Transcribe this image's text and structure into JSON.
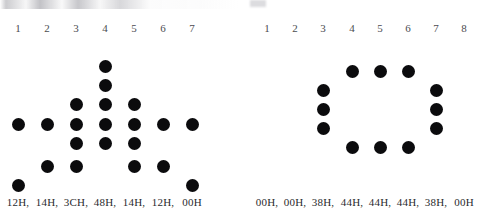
{
  "figure": {
    "dot_color": "#0b0b0d",
    "background_color": "#ffffff",
    "header_color": "#4b4b50",
    "label_color": "#2a2a2e"
  },
  "panels": [
    {
      "id": "left",
      "name": "left-dot-matrix",
      "columns": 7,
      "rows": 8,
      "column_headers": [
        "1",
        "2",
        "3",
        "4",
        "5",
        "6",
        "7"
      ],
      "column_labels": [
        "12H,",
        "14H,",
        "3CH,",
        "48H,",
        "14H,",
        "12H,",
        "00H"
      ],
      "column_bits": [
        {
          "header": "1",
          "label": "12H,",
          "hex": "12H",
          "rows_on": [
            4,
            8
          ]
        },
        {
          "header": "2",
          "label": "14H,",
          "hex": "14H",
          "rows_on": [
            4,
            7
          ]
        },
        {
          "header": "3",
          "label": "3CH,",
          "hex": "3CH",
          "rows_on": [
            3,
            4,
            5,
            7
          ]
        },
        {
          "header": "4",
          "label": "48H,",
          "hex": "48H",
          "rows_on": [
            1,
            2,
            3,
            4,
            5
          ]
        },
        {
          "header": "5",
          "label": "14H,",
          "hex": "14H",
          "rows_on": [
            3,
            4,
            5,
            7
          ]
        },
        {
          "header": "6",
          "label": "12H,",
          "hex": "12H",
          "rows_on": [
            4,
            7
          ]
        },
        {
          "header": "7",
          "label": "00H",
          "hex": "00H",
          "rows_on": [
            4,
            8
          ]
        }
      ],
      "dots": [
        {
          "col": 4,
          "row": 1
        },
        {
          "col": 4,
          "row": 2
        },
        {
          "col": 3,
          "row": 3
        },
        {
          "col": 4,
          "row": 3
        },
        {
          "col": 5,
          "row": 3
        },
        {
          "col": 1,
          "row": 4
        },
        {
          "col": 2,
          "row": 4
        },
        {
          "col": 3,
          "row": 4
        },
        {
          "col": 4,
          "row": 4
        },
        {
          "col": 5,
          "row": 4
        },
        {
          "col": 6,
          "row": 4
        },
        {
          "col": 7,
          "row": 4
        },
        {
          "col": 3,
          "row": 5
        },
        {
          "col": 4,
          "row": 5
        },
        {
          "col": 5,
          "row": 5
        },
        {
          "col": 2,
          "row": 7
        },
        {
          "col": 3,
          "row": 7
        },
        {
          "col": 5,
          "row": 7
        },
        {
          "col": 6,
          "row": 7
        },
        {
          "col": 1,
          "row": 8
        },
        {
          "col": 7,
          "row": 8
        }
      ]
    },
    {
      "id": "right",
      "name": "right-dot-matrix",
      "columns": 8,
      "rows": 8,
      "column_headers": [
        "1",
        "2",
        "3",
        "4",
        "5",
        "6",
        "7",
        "8"
      ],
      "column_labels": [
        "00H,",
        "00H,",
        "38H,",
        "44H,",
        "44H,",
        "44H,",
        "38H,",
        "00H"
      ],
      "column_bits": [
        {
          "header": "1",
          "label": "00H,",
          "hex": "00H",
          "rows_on": []
        },
        {
          "header": "2",
          "label": "00H,",
          "hex": "00H",
          "rows_on": []
        },
        {
          "header": "3",
          "label": "38H,",
          "hex": "38H",
          "rows_on": [
            4,
            5,
            6
          ]
        },
        {
          "header": "4",
          "label": "44H,",
          "hex": "44H",
          "rows_on": [
            3,
            7
          ]
        },
        {
          "header": "5",
          "label": "44H,",
          "hex": "44H",
          "rows_on": [
            3,
            7
          ]
        },
        {
          "header": "6",
          "label": "44H,",
          "hex": "44H",
          "rows_on": [
            3,
            7
          ]
        },
        {
          "header": "7",
          "label": "38H,",
          "hex": "38H",
          "rows_on": [
            4,
            5,
            6
          ]
        },
        {
          "header": "8",
          "label": "00H",
          "hex": "00H",
          "rows_on": []
        }
      ],
      "dots": [
        {
          "col": 4,
          "row": 3
        },
        {
          "col": 5,
          "row": 3
        },
        {
          "col": 6,
          "row": 3
        },
        {
          "col": 3,
          "row": 4
        },
        {
          "col": 7,
          "row": 4
        },
        {
          "col": 3,
          "row": 5
        },
        {
          "col": 7,
          "row": 5
        },
        {
          "col": 3,
          "row": 6
        },
        {
          "col": 7,
          "row": 6
        },
        {
          "col": 4,
          "row": 7
        },
        {
          "col": 5,
          "row": 7
        },
        {
          "col": 6,
          "row": 7
        }
      ]
    }
  ],
  "geometry": {
    "left": {
      "col_x": [
        18,
        47,
        76,
        105,
        134,
        163,
        192
      ],
      "row_y": [
        66,
        85,
        104,
        124,
        143,
        162,
        166,
        185
      ],
      "header_y": 22,
      "label_y": 196
    },
    "right": {
      "col_x": [
        19,
        47,
        75,
        104,
        132,
        160,
        188,
        216
      ],
      "row_y": [
        34,
        53,
        71,
        90,
        109,
        128,
        147,
        166
      ],
      "header_y": 22,
      "label_y": 196
    }
  }
}
